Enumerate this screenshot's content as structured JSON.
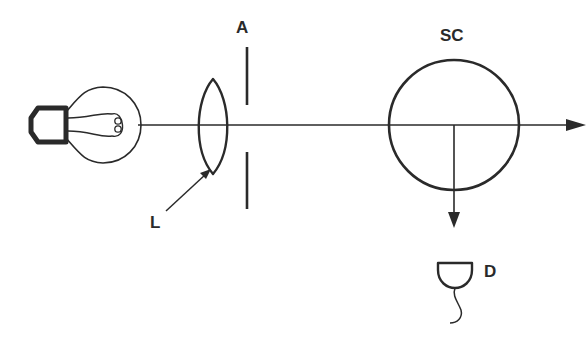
{
  "diagram": {
    "type": "optical light-scattering setup",
    "components": [
      {
        "id": "lamp",
        "description": "light bulb source"
      },
      {
        "id": "lens",
        "label": "L"
      },
      {
        "id": "aperture",
        "label": "A"
      },
      {
        "id": "scattering_cell",
        "label": "SC"
      },
      {
        "id": "detector",
        "label": "D"
      }
    ],
    "labels": {
      "lens": "L",
      "aperture": "A",
      "scattering_cell": "SC",
      "detector": "D"
    },
    "colors": {
      "stroke": "#2a2a2a",
      "background": "#ffffff"
    }
  }
}
